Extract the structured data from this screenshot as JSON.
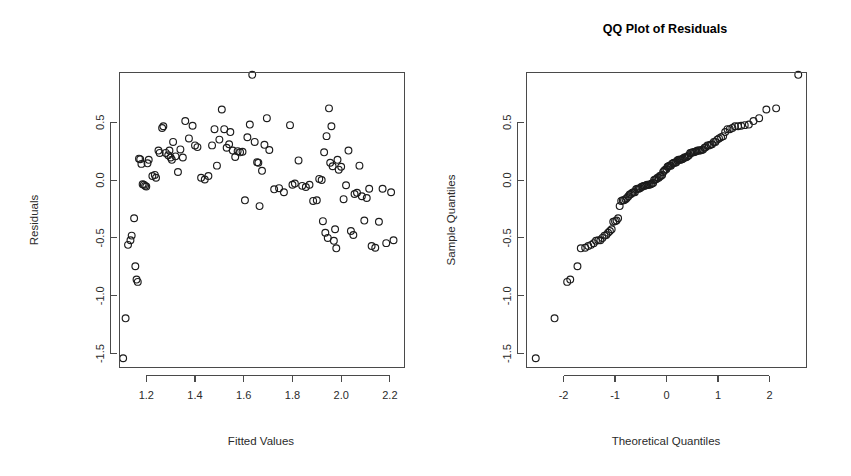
{
  "figure": {
    "width": 851,
    "height": 476,
    "background": "#ffffff",
    "point_color": "#1c1c1c",
    "axis_color": "#4a4a4a",
    "text_color": "#2b2b2b",
    "point_symbol": "open-circle",
    "point_radius": 3.4
  },
  "chart_data": [
    {
      "type": "scatter",
      "panel": "left",
      "title": "",
      "xlabel": "Fitted Values",
      "ylabel": "Residuals",
      "xlim": [
        1.09,
        2.26
      ],
      "ylim": [
        -1.62,
        0.93
      ],
      "xticks": [
        1.2,
        1.4,
        1.6,
        1.8,
        2.0,
        2.2
      ],
      "xtick_labels": [
        "1.2",
        "1.4",
        "1.6",
        "1.8",
        "2.0",
        "2.2"
      ],
      "yticks": [
        0.5,
        0.0,
        -0.5,
        -1.0,
        -1.5
      ],
      "ytick_labels": [
        "0.5",
        "0.0",
        "-0.5",
        "-1.0",
        "-1.5"
      ],
      "grid": false,
      "legend": "none",
      "plot_box": true,
      "x": [
        1.105,
        1.115,
        1.125,
        1.135,
        1.14,
        1.15,
        1.155,
        1.16,
        1.165,
        1.17,
        1.175,
        1.18,
        1.185,
        1.19,
        1.195,
        1.2,
        1.205,
        1.21,
        1.225,
        1.235,
        1.24,
        1.25,
        1.255,
        1.265,
        1.27,
        1.28,
        1.29,
        1.295,
        1.3,
        1.305,
        1.31,
        1.32,
        1.33,
        1.34,
        1.35,
        1.36,
        1.375,
        1.39,
        1.4,
        1.41,
        1.425,
        1.44,
        1.455,
        1.47,
        1.48,
        1.49,
        1.5,
        1.51,
        1.52,
        1.53,
        1.54,
        1.545,
        1.555,
        1.565,
        1.575,
        1.585,
        1.595,
        1.605,
        1.615,
        1.625,
        1.635,
        1.645,
        1.655,
        1.66,
        1.665,
        1.675,
        1.685,
        1.695,
        1.705,
        1.725,
        1.745,
        1.765,
        1.79,
        1.8,
        1.81,
        1.825,
        1.84,
        1.855,
        1.87,
        1.885,
        1.9,
        1.91,
        1.92,
        1.925,
        1.93,
        1.935,
        1.94,
        1.945,
        1.95,
        1.955,
        1.96,
        1.965,
        1.97,
        1.975,
        1.98,
        1.985,
        1.99,
        2.0,
        2.01,
        2.02,
        2.03,
        2.04,
        2.05,
        2.055,
        2.065,
        2.075,
        2.085,
        2.095,
        2.105,
        2.115,
        2.125,
        2.14,
        2.155,
        2.17,
        2.185,
        2.205,
        2.215
      ],
      "y": [
        -1.54,
        -1.195,
        -0.56,
        -0.52,
        -0.48,
        -0.33,
        -0.745,
        -0.86,
        -0.88,
        0.185,
        0.18,
        0.14,
        -0.035,
        -0.04,
        -0.05,
        -0.055,
        0.145,
        0.175,
        0.035,
        0.045,
        0.02,
        0.255,
        0.235,
        0.45,
        0.465,
        0.235,
        0.215,
        0.255,
        0.195,
        0.175,
        0.33,
        0.205,
        0.07,
        0.265,
        0.195,
        0.51,
        0.36,
        0.47,
        0.3,
        0.285,
        0.02,
        0.005,
        0.035,
        0.3,
        0.44,
        0.125,
        0.35,
        0.61,
        0.44,
        0.28,
        0.31,
        0.415,
        0.255,
        0.2,
        0.25,
        0.24,
        0.245,
        -0.175,
        0.37,
        0.48,
        0.91,
        0.33,
        0.155,
        0.15,
        -0.225,
        0.08,
        0.305,
        0.535,
        0.26,
        -0.08,
        -0.07,
        -0.105,
        0.475,
        -0.04,
        -0.03,
        0.17,
        -0.05,
        -0.06,
        -0.04,
        -0.18,
        -0.175,
        0.01,
        0.0,
        -0.355,
        0.24,
        -0.455,
        0.38,
        -0.5,
        0.62,
        0.15,
        0.465,
        0.12,
        -0.525,
        -0.425,
        -0.59,
        0.175,
        0.09,
        0.115,
        -0.165,
        -0.045,
        0.255,
        -0.44,
        -0.475,
        -0.12,
        -0.11,
        0.125,
        -0.14,
        -0.35,
        -0.155,
        -0.075,
        -0.57,
        -0.585,
        -0.36,
        -0.075,
        -0.545,
        -0.105,
        -0.52,
        0.095,
        -0.125
      ]
    },
    {
      "type": "scatter",
      "panel": "right",
      "title": "QQ Plot of Residuals",
      "xlabel": "Theoretical Quantiles",
      "ylabel": "Sample Quantiles",
      "xlim": [
        -2.72,
        2.72
      ],
      "ylim": [
        -1.62,
        0.93
      ],
      "xticks": [
        -2,
        -1,
        0,
        1,
        2
      ],
      "xtick_labels": [
        "-2",
        "-1",
        "0",
        "1",
        "2"
      ],
      "yticks": [
        0.5,
        0.0,
        -0.5,
        -1.0,
        -1.5
      ],
      "ytick_labels": [
        "0.5",
        "0.0",
        "-0.5",
        "-1.0",
        "-1.5"
      ],
      "grid": false,
      "legend": "none",
      "plot_box": true,
      "note": "sample quantiles are the sorted residuals of the left panel plotted against normal theoretical quantiles",
      "x": [
        -2.54,
        -2.175,
        -1.93,
        -1.87,
        -1.73,
        -1.665,
        -1.58,
        -1.52,
        -1.465,
        -1.415,
        -1.37,
        -1.325,
        -1.285,
        -1.245,
        -1.205,
        -1.17,
        -1.135,
        -1.1,
        -1.065,
        -1.035,
        -1.0,
        -0.97,
        -0.94,
        -0.91,
        -0.88,
        -0.85,
        -0.825,
        -0.795,
        -0.77,
        -0.74,
        -0.715,
        -0.69,
        -0.665,
        -0.64,
        -0.615,
        -0.59,
        -0.565,
        -0.54,
        -0.515,
        -0.49,
        -0.465,
        -0.445,
        -0.42,
        -0.395,
        -0.375,
        -0.35,
        -0.33,
        -0.305,
        -0.285,
        -0.26,
        -0.24,
        -0.215,
        -0.195,
        -0.175,
        -0.15,
        -0.13,
        -0.11,
        -0.085,
        -0.065,
        -0.045,
        -0.025,
        0.0,
        0.02,
        0.04,
        0.06,
        0.085,
        0.105,
        0.125,
        0.145,
        0.17,
        0.19,
        0.21,
        0.235,
        0.255,
        0.275,
        0.3,
        0.32,
        0.345,
        0.365,
        0.39,
        0.41,
        0.435,
        0.46,
        0.48,
        0.505,
        0.53,
        0.555,
        0.58,
        0.605,
        0.63,
        0.655,
        0.685,
        0.71,
        0.74,
        0.765,
        0.795,
        0.825,
        0.855,
        0.885,
        0.92,
        0.95,
        0.985,
        1.02,
        1.06,
        1.1,
        1.14,
        1.185,
        1.23,
        1.28,
        1.33,
        1.39,
        1.45,
        1.52,
        1.6,
        1.69,
        1.8,
        1.94,
        2.13,
        2.56
      ],
      "y": [
        -1.54,
        -1.195,
        -0.88,
        -0.86,
        -0.745,
        -0.59,
        -0.585,
        -0.57,
        -0.56,
        -0.545,
        -0.525,
        -0.52,
        -0.52,
        -0.5,
        -0.48,
        -0.475,
        -0.455,
        -0.44,
        -0.425,
        -0.36,
        -0.355,
        -0.35,
        -0.33,
        -0.225,
        -0.18,
        -0.175,
        -0.175,
        -0.165,
        -0.155,
        -0.14,
        -0.125,
        -0.12,
        -0.11,
        -0.105,
        -0.105,
        -0.08,
        -0.075,
        -0.075,
        -0.07,
        -0.06,
        -0.055,
        -0.05,
        -0.05,
        -0.045,
        -0.04,
        -0.04,
        -0.04,
        -0.035,
        -0.03,
        -0.025,
        0.0,
        0.005,
        0.01,
        0.02,
        0.02,
        0.035,
        0.035,
        0.045,
        0.07,
        0.08,
        0.09,
        0.095,
        0.115,
        0.12,
        0.125,
        0.125,
        0.14,
        0.145,
        0.15,
        0.15,
        0.155,
        0.17,
        0.175,
        0.175,
        0.175,
        0.18,
        0.185,
        0.195,
        0.195,
        0.2,
        0.205,
        0.215,
        0.235,
        0.235,
        0.24,
        0.24,
        0.245,
        0.25,
        0.255,
        0.255,
        0.255,
        0.26,
        0.265,
        0.28,
        0.285,
        0.3,
        0.3,
        0.305,
        0.31,
        0.33,
        0.33,
        0.35,
        0.36,
        0.37,
        0.38,
        0.415,
        0.44,
        0.44,
        0.45,
        0.465,
        0.465,
        0.47,
        0.475,
        0.48,
        0.51,
        0.535,
        0.61,
        0.62,
        0.91
      ]
    }
  ]
}
